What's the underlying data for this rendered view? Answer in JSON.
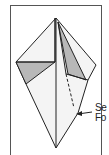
{
  "diagram": {
    "type": "origami-fold-step",
    "labels": [
      {
        "text": "Se"
      },
      {
        "text": "Fo"
      }
    ],
    "colors": {
      "paper": "#f4f4f4",
      "shaded": "#b8b8b8",
      "line": "#222222",
      "frame": "#555555"
    }
  }
}
